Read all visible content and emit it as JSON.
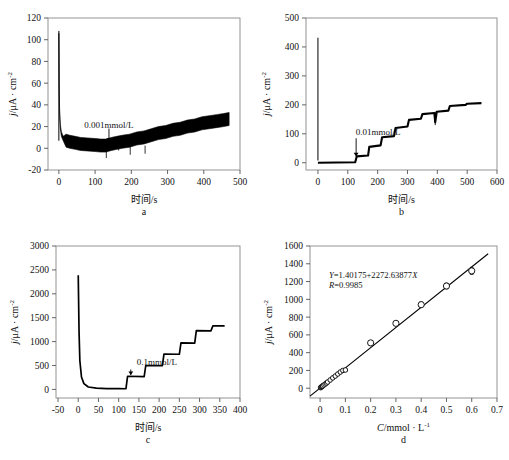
{
  "figure": {
    "panels": [
      {
        "letter": "a",
        "xlabel": "时间/s",
        "ylabel_parts": {
          "j": "j",
          "slash": "/μA · cm",
          "sup": "-2"
        },
        "annotation": "0.001mmol/L",
        "annotation_x": 130,
        "annotation_y": 20,
        "xticks": [
          0,
          100,
          200,
          300,
          400,
          500
        ],
        "yticks": [
          -20,
          0,
          20,
          40,
          60,
          80,
          100,
          120
        ],
        "xlim": [
          -30,
          500
        ],
        "ylim": [
          -20,
          120
        ],
        "spike_peak": 106,
        "noise_band": 6,
        "series_name": "current-density-vs-time",
        "points": [
          [
            0,
            106
          ],
          [
            1,
            60
          ],
          [
            2,
            34
          ],
          [
            4,
            20
          ],
          [
            7,
            13
          ],
          [
            12,
            9
          ],
          [
            20,
            7
          ],
          [
            30,
            6
          ],
          [
            45,
            5
          ],
          [
            60,
            4
          ],
          [
            80,
            3.5
          ],
          [
            100,
            3
          ],
          [
            115,
            2.5
          ],
          [
            130,
            2.5
          ],
          [
            145,
            4
          ],
          [
            160,
            5
          ],
          [
            175,
            6
          ],
          [
            195,
            7
          ],
          [
            215,
            9
          ],
          [
            235,
            10
          ],
          [
            255,
            12
          ],
          [
            275,
            14
          ],
          [
            295,
            15
          ],
          [
            315,
            17
          ],
          [
            335,
            18
          ],
          [
            355,
            20
          ],
          [
            375,
            21
          ],
          [
            395,
            23
          ],
          [
            415,
            24
          ],
          [
            435,
            25
          ],
          [
            455,
            26
          ],
          [
            470,
            27
          ]
        ],
        "downspikes": [
          [
            131,
            -9
          ],
          [
            165,
            -2
          ],
          [
            197,
            -6
          ],
          [
            238,
            -5
          ]
        ]
      },
      {
        "letter": "b",
        "xlabel": "时间/s",
        "ylabel_parts": {
          "j": "j",
          "slash": "/μA · cm",
          "sup": "-2"
        },
        "annotation": "0.01mmol/L",
        "annotation_x": 128,
        "annotation_y": 95,
        "xticks": [
          0,
          100,
          200,
          300,
          400,
          500,
          600
        ],
        "yticks": [
          0,
          100,
          200,
          300,
          400,
          500
        ],
        "xlim": [
          -40,
          600
        ],
        "ylim": [
          -25,
          500
        ],
        "spike_peak": 432,
        "noise_band": 4,
        "series_name": "current-density-vs-time",
        "steps": [
          [
            0,
            0
          ],
          [
            125,
            2
          ],
          [
            130,
            22
          ],
          [
            168,
            25
          ],
          [
            172,
            55
          ],
          [
            210,
            60
          ],
          [
            215,
            88
          ],
          [
            255,
            92
          ],
          [
            260,
            120
          ],
          [
            300,
            125
          ],
          [
            305,
            148
          ],
          [
            345,
            152
          ],
          [
            350,
            168
          ],
          [
            390,
            172
          ],
          [
            393,
            140
          ],
          [
            398,
            176
          ],
          [
            437,
            180
          ],
          [
            442,
            196
          ],
          [
            495,
            200
          ],
          [
            500,
            204
          ],
          [
            548,
            206
          ]
        ],
        "downspikes": [
          [
            393,
            130
          ]
        ]
      },
      {
        "letter": "c",
        "xlabel": "时间/s",
        "ylabel_parts": {
          "j": "j",
          "slash": "/μA · cm",
          "sup": "-2"
        },
        "annotation": "0.1mmol/L",
        "annotation_x": 125,
        "annotation_y": 500,
        "xticks": [
          -50,
          0,
          50,
          100,
          150,
          200,
          250,
          300,
          350,
          400
        ],
        "yticks": [
          0,
          500,
          1000,
          1500,
          2000,
          2500,
          3000
        ],
        "xlim": [
          -55,
          400
        ],
        "ylim": [
          -180,
          3000
        ],
        "spike_peak": 2390,
        "noise_band": 10,
        "series_name": "current-density-vs-time",
        "steps": [
          [
            0,
            2390
          ],
          [
            2,
            1200
          ],
          [
            4,
            600
          ],
          [
            8,
            260
          ],
          [
            14,
            120
          ],
          [
            25,
            50
          ],
          [
            45,
            25
          ],
          [
            70,
            18
          ],
          [
            100,
            15
          ],
          [
            118,
            14
          ],
          [
            122,
            275
          ],
          [
            163,
            268
          ],
          [
            167,
            500
          ],
          [
            208,
            495
          ],
          [
            212,
            740
          ],
          [
            250,
            735
          ],
          [
            254,
            975
          ],
          [
            288,
            968
          ],
          [
            292,
            1230
          ],
          [
            328,
            1225
          ],
          [
            333,
            1330
          ],
          [
            362,
            1328
          ]
        ],
        "downspikes": []
      },
      {
        "letter": "d",
        "xlabel_parts": {
          "c": "C",
          "rest": "/mmol · L",
          "sup": "-1"
        },
        "ylabel_parts": {
          "j": "j",
          "slash": "/μA · cm",
          "sup": "-2"
        },
        "equation": "Y=1.40175+2272.63877X",
        "equation_italic_y": "Y",
        "equation_italic_x": "X",
        "r_value": "R=0.9985",
        "xticks": [
          0,
          0.1,
          0.2,
          0.3,
          0.4,
          0.5,
          0.6,
          0.7
        ],
        "yticks": [
          0,
          200,
          400,
          600,
          800,
          1000,
          1200,
          1400,
          1600
        ],
        "xlim": [
          -0.04,
          0.7
        ],
        "ylim": [
          -110,
          1600
        ],
        "fit_slope": 2272.63877,
        "fit_intercept": 1.40175,
        "series_name": "calibration-curve"
      }
    ],
    "calibration_points": [
      {
        "x": 0.002,
        "y": 6,
        "err": 4
      },
      {
        "x": 0.004,
        "y": 12,
        "err": 4
      },
      {
        "x": 0.006,
        "y": 17,
        "err": 4
      },
      {
        "x": 0.008,
        "y": 22,
        "err": 4
      },
      {
        "x": 0.01,
        "y": 26,
        "err": 4
      },
      {
        "x": 0.015,
        "y": 36,
        "err": 5
      },
      {
        "x": 0.02,
        "y": 47,
        "err": 5
      },
      {
        "x": 0.025,
        "y": 58,
        "err": 5
      },
      {
        "x": 0.03,
        "y": 70,
        "err": 6
      },
      {
        "x": 0.04,
        "y": 93,
        "err": 6
      },
      {
        "x": 0.05,
        "y": 116,
        "err": 7
      },
      {
        "x": 0.06,
        "y": 137,
        "err": 8
      },
      {
        "x": 0.07,
        "y": 160,
        "err": 8
      },
      {
        "x": 0.08,
        "y": 182,
        "err": 9
      },
      {
        "x": 0.09,
        "y": 200,
        "err": 10
      },
      {
        "x": 0.1,
        "y": 205,
        "err": 12
      },
      {
        "x": 0.2,
        "y": 510,
        "err": 22
      },
      {
        "x": 0.3,
        "y": 730,
        "err": 25
      },
      {
        "x": 0.4,
        "y": 940,
        "err": 30
      },
      {
        "x": 0.5,
        "y": 1150,
        "err": 32
      },
      {
        "x": 0.6,
        "y": 1320,
        "err": 40
      }
    ]
  }
}
